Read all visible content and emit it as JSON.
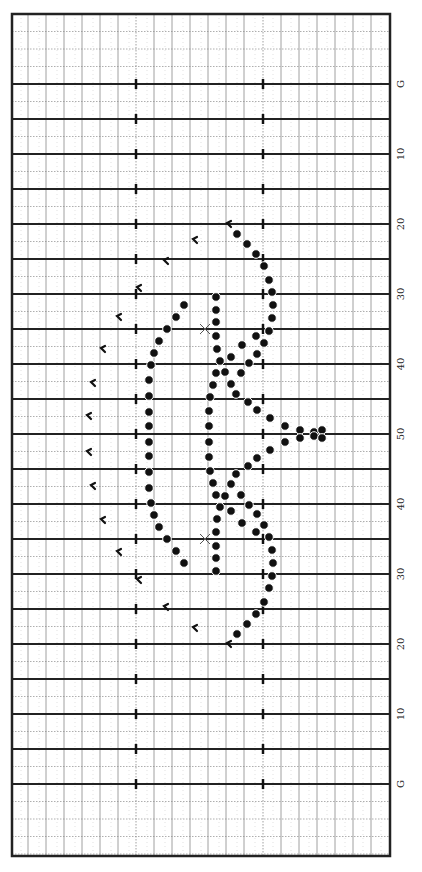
{
  "field": {
    "left": 12,
    "right": 390,
    "top": 14,
    "bottom": 856,
    "goal_top_y": 84,
    "yard_spacing_5": 35,
    "hash_x": [
      136,
      263
    ],
    "grid_cols_x": [
      28,
      46,
      64,
      82,
      100,
      118,
      154,
      172,
      190,
      208,
      226,
      244,
      281,
      299,
      317,
      335,
      353,
      371
    ],
    "minor_rows_per_5yd": 2
  },
  "yard_labels": [
    {
      "text": "G",
      "y": 84
    },
    {
      "text": "10",
      "y": 154
    },
    {
      "text": "20",
      "y": 224
    },
    {
      "text": "30",
      "y": 294
    },
    {
      "text": "40",
      "y": 364
    },
    {
      "text": "50",
      "y": 434
    },
    {
      "text": "40",
      "y": 504
    },
    {
      "text": "30",
      "y": 574
    },
    {
      "text": "20",
      "y": 644
    },
    {
      "text": "10",
      "y": 714
    },
    {
      "text": "G",
      "y": 784
    }
  ],
  "markers": {
    "dot_color": "#111111",
    "x_marks": [
      [
        205,
        329
      ],
      [
        205,
        539
      ]
    ],
    "flags": [
      [
        228,
        224
      ],
      [
        194,
        240
      ],
      [
        165,
        261
      ],
      [
        138,
        288
      ],
      [
        118,
        317
      ],
      [
        102,
        349
      ],
      [
        92,
        383
      ],
      [
        88,
        416
      ],
      [
        88,
        452
      ],
      [
        92,
        486
      ],
      [
        102,
        520
      ],
      [
        118,
        552
      ],
      [
        138,
        580
      ],
      [
        165,
        607
      ],
      [
        194,
        628
      ],
      [
        228,
        644
      ]
    ],
    "dots": [
      [
        237,
        234
      ],
      [
        247,
        244
      ],
      [
        256,
        254
      ],
      [
        264,
        266
      ],
      [
        269,
        280
      ],
      [
        272,
        292
      ],
      [
        273,
        305
      ],
      [
        272,
        318
      ],
      [
        269,
        331
      ],
      [
        264,
        343
      ],
      [
        257,
        354
      ],
      [
        249,
        363
      ],
      [
        241,
        373
      ],
      [
        231,
        384
      ],
      [
        236,
        394
      ],
      [
        248,
        402
      ],
      [
        257,
        410
      ],
      [
        270,
        418
      ],
      [
        285,
        426
      ],
      [
        300,
        430
      ],
      [
        314,
        432
      ],
      [
        322,
        430
      ],
      [
        184,
        305
      ],
      [
        176,
        317
      ],
      [
        167,
        329
      ],
      [
        159,
        341
      ],
      [
        154,
        353
      ],
      [
        151,
        365
      ],
      [
        149,
        380
      ],
      [
        149,
        396
      ],
      [
        149,
        412
      ],
      [
        149,
        426
      ],
      [
        216,
        297
      ],
      [
        216,
        310
      ],
      [
        216,
        322
      ],
      [
        216,
        336
      ],
      [
        217,
        349
      ],
      [
        220,
        361
      ],
      [
        216,
        373
      ],
      [
        213,
        385
      ],
      [
        210,
        397
      ],
      [
        209,
        411
      ],
      [
        209,
        426
      ],
      [
        225,
        372
      ],
      [
        231,
        357
      ],
      [
        242,
        345
      ],
      [
        256,
        336
      ],
      [
        237,
        634
      ],
      [
        247,
        624
      ],
      [
        256,
        614
      ],
      [
        264,
        602
      ],
      [
        269,
        588
      ],
      [
        272,
        576
      ],
      [
        273,
        563
      ],
      [
        272,
        550
      ],
      [
        269,
        537
      ],
      [
        264,
        525
      ],
      [
        257,
        514
      ],
      [
        249,
        505
      ],
      [
        241,
        495
      ],
      [
        231,
        484
      ],
      [
        236,
        474
      ],
      [
        248,
        466
      ],
      [
        257,
        458
      ],
      [
        270,
        450
      ],
      [
        285,
        442
      ],
      [
        300,
        438
      ],
      [
        314,
        436
      ],
      [
        322,
        438
      ],
      [
        184,
        563
      ],
      [
        176,
        551
      ],
      [
        167,
        539
      ],
      [
        159,
        527
      ],
      [
        154,
        515
      ],
      [
        151,
        503
      ],
      [
        149,
        488
      ],
      [
        149,
        472
      ],
      [
        149,
        456
      ],
      [
        149,
        442
      ],
      [
        216,
        571
      ],
      [
        216,
        558
      ],
      [
        216,
        546
      ],
      [
        216,
        532
      ],
      [
        217,
        519
      ],
      [
        220,
        507
      ],
      [
        216,
        495
      ],
      [
        213,
        483
      ],
      [
        210,
        471
      ],
      [
        209,
        457
      ],
      [
        209,
        442
      ],
      [
        225,
        496
      ],
      [
        231,
        511
      ],
      [
        242,
        523
      ],
      [
        256,
        532
      ]
    ]
  }
}
